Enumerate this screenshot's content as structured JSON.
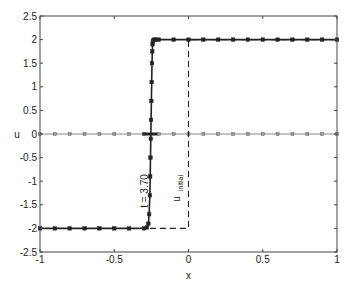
{
  "chart_data": {
    "type": "line",
    "title": "",
    "xlabel": "x",
    "ylabel": "u",
    "xlim": [
      -1,
      1
    ],
    "ylim": [
      -2.5,
      2.5
    ],
    "grid": false,
    "legend": null,
    "x_ticks": [
      -1,
      -0.5,
      0,
      0.5,
      1
    ],
    "x_tick_labels": [
      "-1",
      "-0.5",
      "0",
      "0.5",
      "1"
    ],
    "y_ticks": [
      -2.5,
      -2,
      -1.5,
      -1,
      -0.5,
      0,
      0.5,
      1,
      1.5,
      2,
      2.5
    ],
    "y_tick_labels": [
      "-2.5",
      "-2",
      "-1.5",
      "-1",
      "-0.5",
      "0",
      "0.5",
      "1",
      "1.5",
      "2",
      "2.5"
    ],
    "annotations": [
      {
        "text": "t = 3.70",
        "x": -0.31,
        "y": -1.1,
        "rotation": -90
      },
      {
        "text": "u",
        "subscript": "initial",
        "x": -0.06,
        "y": -1.1,
        "rotation": -90
      }
    ],
    "series": [
      {
        "name": "u(t=3.70)",
        "style": "solid",
        "color": "#222222",
        "marker": "square",
        "x": [
          -1,
          -0.9,
          -0.8,
          -0.7,
          -0.6,
          -0.5,
          -0.4,
          -0.3,
          -0.28,
          -0.27,
          -0.265,
          -0.26,
          -0.258,
          -0.256,
          -0.254,
          -0.252,
          -0.25,
          -0.248,
          -0.246,
          -0.244,
          -0.242,
          -0.24,
          -0.235,
          -0.23,
          -0.22,
          -0.2,
          -0.1,
          0,
          0.1,
          0.2,
          0.3,
          0.4,
          0.5,
          0.6,
          0.7,
          0.8,
          0.9,
          1
        ],
        "y": [
          -2,
          -2,
          -2,
          -2,
          -2,
          -2,
          -2,
          -2,
          -1.98,
          -1.9,
          -1.7,
          -1.3,
          -0.9,
          -0.5,
          -0.1,
          0.3,
          0.7,
          1.1,
          1.5,
          1.75,
          1.9,
          1.96,
          1.99,
          2,
          2,
          2,
          2,
          2,
          2,
          2,
          2,
          2,
          2,
          2,
          2,
          2,
          2,
          2
        ]
      },
      {
        "name": "u_initial",
        "style": "dashed",
        "color": "#222222",
        "marker": "none",
        "x": [
          -0.26,
          0,
          0,
          1
        ],
        "y": [
          -2,
          -2,
          2,
          2
        ]
      },
      {
        "name": "zero-level",
        "style": "solid",
        "color": "#888888",
        "marker": "square",
        "x": [
          -1,
          -0.9,
          -0.8,
          -0.7,
          -0.6,
          -0.5,
          -0.4,
          -0.3,
          -0.2,
          -0.1,
          0,
          0.1,
          0.2,
          0.3,
          0.4,
          0.5,
          0.6,
          0.7,
          0.8,
          0.9,
          1
        ],
        "y": [
          0,
          0,
          0,
          0,
          0,
          0,
          0,
          0,
          0,
          0,
          0,
          0,
          0,
          0,
          0,
          0,
          0,
          0,
          0,
          0,
          0
        ]
      }
    ]
  },
  "labels": {
    "xlabel": "x",
    "ylabel": "u",
    "time_annotation": "t = 3.70",
    "initial_main": "u",
    "initial_sub": "initial"
  }
}
